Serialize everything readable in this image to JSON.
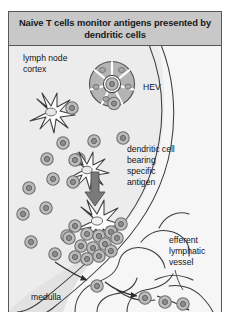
{
  "figure": {
    "title": "Naive T cells monitor antigens presented by dendritic cells",
    "labels": {
      "cortex_line1": "lymph node",
      "cortex_line2": "cortex",
      "hev": "HEV",
      "dc_line1": "dendritic cell",
      "dc_line2": "bearing",
      "dc_line3": "specific",
      "dc_line4": "antigen",
      "efferent_line1": "efferent",
      "efferent_line2": "lymphatic",
      "efferent_line3": "vessel",
      "medulla": "medulla"
    },
    "colors": {
      "header_bg": "#c8c8c8",
      "border": "#55585c",
      "cortex_fill": "#ececec",
      "medulla_fill": "#e2e2e2",
      "cell_ring": "#8d8d8d",
      "cell_fill": "#bcbcbc",
      "hev_wedge": "#b4b4b4",
      "arrow": "#6e6e6e",
      "outline": "#3a3c3f",
      "text": "#121416"
    },
    "elements": {
      "hev_wedge_count": 7,
      "capsule_arcs": 2,
      "dendritic_cells": 2,
      "migration_arrows": 4
    }
  }
}
